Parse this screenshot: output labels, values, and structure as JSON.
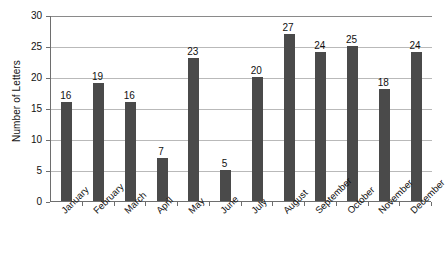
{
  "chart_data": {
    "type": "bar",
    "title": "",
    "xlabel": "",
    "ylabel": "Number of Letters",
    "ylim": [
      0,
      30
    ],
    "yticks": [
      0,
      5,
      10,
      15,
      20,
      25,
      30
    ],
    "grid": true,
    "legend": "none",
    "bar_color": "#4a4a4a",
    "gridline_color": "#b9b9b9",
    "axis_color": "#6e6e6e",
    "show_value_labels": true,
    "xtick_rotation": 45,
    "categories": [
      "January",
      "February",
      "March",
      "April",
      "May",
      "June",
      "July",
      "August",
      "September",
      "October",
      "November",
      "December"
    ],
    "values": [
      16,
      19,
      16,
      7,
      23,
      5,
      20,
      27,
      24,
      25,
      18,
      24
    ]
  }
}
